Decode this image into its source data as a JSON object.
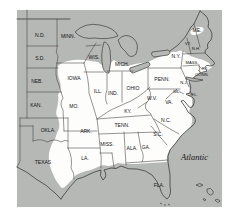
{
  "map": {
    "description_label": "Atlantic",
    "colors": {
      "page_bg": "#ffffff",
      "land_gray": "#b6b8b5",
      "range_white": "#fdfdfc",
      "line": "#3e3e3e",
      "label": "#151515"
    },
    "ocean_label": {
      "text": "Atlantic"
    },
    "state_labels": [
      {
        "text": "N.D.",
        "x": 40,
        "y": 37,
        "size": 5
      },
      {
        "text": "MINN.",
        "x": 68,
        "y": 38,
        "size": 5
      },
      {
        "text": "S.D.",
        "x": 40,
        "y": 60,
        "size": 5
      },
      {
        "text": "WIS.",
        "x": 94,
        "y": 59,
        "size": 5
      },
      {
        "text": "NEB.",
        "x": 37,
        "y": 83,
        "size": 5
      },
      {
        "text": "IOWA",
        "x": 74,
        "y": 80,
        "size": 5
      },
      {
        "text": "ILL.",
        "x": 98,
        "y": 93,
        "size": 5
      },
      {
        "text": "IND.",
        "x": 113,
        "y": 95,
        "size": 5
      },
      {
        "text": "OHIO",
        "x": 133,
        "y": 90,
        "size": 5
      },
      {
        "text": "MICH.",
        "x": 122,
        "y": 66,
        "size": 5
      },
      {
        "text": "KAN.",
        "x": 36,
        "y": 107,
        "size": 5
      },
      {
        "text": "MO.",
        "x": 74,
        "y": 108,
        "size": 5
      },
      {
        "text": "OKLA.",
        "x": 48,
        "y": 132,
        "size": 5
      },
      {
        "text": "ARK.",
        "x": 86,
        "y": 133,
        "size": 5
      },
      {
        "text": "TEXAS",
        "x": 43,
        "y": 164,
        "size": 5
      },
      {
        "text": "LA.",
        "x": 85,
        "y": 160,
        "size": 5
      },
      {
        "text": "MISS.",
        "x": 107,
        "y": 146,
        "size": 5
      },
      {
        "text": "ALA.",
        "x": 132,
        "y": 150,
        "size": 5
      },
      {
        "text": "GA.",
        "x": 146,
        "y": 149,
        "size": 5
      },
      {
        "text": "TENN.",
        "x": 122,
        "y": 127,
        "size": 5
      },
      {
        "text": "KY.",
        "x": 128,
        "y": 113,
        "size": 5
      },
      {
        "text": "W.V.",
        "x": 152,
        "y": 100,
        "size": 5
      },
      {
        "text": "VA.",
        "x": 169,
        "y": 104,
        "size": 5
      },
      {
        "text": "N.C.",
        "x": 166,
        "y": 122,
        "size": 5
      },
      {
        "text": "S.C.",
        "x": 158,
        "y": 136,
        "size": 5
      },
      {
        "text": "FLA.",
        "x": 159,
        "y": 187,
        "size": 5
      },
      {
        "text": "PENN.",
        "x": 162,
        "y": 81,
        "size": 5
      },
      {
        "text": "N.Y.",
        "x": 176,
        "y": 58,
        "size": 5
      },
      {
        "text": "ME.",
        "x": 197,
        "y": 32,
        "size": 5
      },
      {
        "text": "VT.",
        "x": 188,
        "y": 45,
        "size": 4
      },
      {
        "text": "N.H.",
        "x": 196,
        "y": 50,
        "size": 4
      },
      {
        "text": "MASS.",
        "x": 192,
        "y": 64,
        "size": 4
      },
      {
        "text": "R.I.",
        "x": 205,
        "y": 70,
        "size": 4
      },
      {
        "text": "CONN.",
        "x": 202,
        "y": 76,
        "size": 4
      },
      {
        "text": "N.J.",
        "x": 184,
        "y": 84,
        "size": 4
      },
      {
        "text": "MD.",
        "x": 177,
        "y": 93,
        "size": 4
      },
      {
        "text": "DEL.",
        "x": 193,
        "y": 96,
        "size": 4
      }
    ]
  }
}
